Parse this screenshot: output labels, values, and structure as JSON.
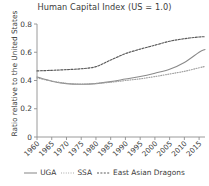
{
  "chart_data": {
    "type": "line",
    "title": "Human Capital Index (US = 1.0)",
    "xlabel": "",
    "ylabel": "Ratio relative to the United States",
    "xlim": [
      1960,
      2017
    ],
    "ylim": [
      0,
      0.8
    ],
    "yticks": [
      "0",
      "0.2",
      "0.4",
      "0.6",
      "0.8"
    ],
    "ytick_values": [
      0,
      0.2,
      0.4,
      0.6,
      0.8
    ],
    "xticks": [
      "1960",
      "1965",
      "1970",
      "1975",
      "1980",
      "1985",
      "1990",
      "1995",
      "2000",
      "2005",
      "2010",
      "2015"
    ],
    "xtick_values": [
      1960,
      1965,
      1970,
      1975,
      1980,
      1985,
      1990,
      1995,
      2000,
      2005,
      2010,
      2015
    ],
    "grid": false,
    "legend_position": "bottom",
    "x": [
      1960,
      1965,
      1970,
      1975,
      1980,
      1985,
      1990,
      1995,
      2000,
      2005,
      2010,
      2015,
      2017
    ],
    "series": [
      {
        "name": "UGA",
        "style": "solid",
        "color": "#8a8a8a",
        "values": [
          0.425,
          0.395,
          0.378,
          0.374,
          0.378,
          0.392,
          0.41,
          0.428,
          0.452,
          0.48,
          0.528,
          0.6,
          0.62
        ]
      },
      {
        "name": "SSA",
        "style": "dotted",
        "color": "#a0a0a0",
        "values": [
          0.418,
          0.396,
          0.38,
          0.374,
          0.379,
          0.388,
          0.4,
          0.412,
          0.428,
          0.446,
          0.465,
          0.49,
          0.5
        ]
      },
      {
        "name": "East Asian Dragons",
        "style": "dashed",
        "color": "#5a5a5a",
        "values": [
          0.468,
          0.472,
          0.477,
          0.483,
          0.498,
          0.545,
          0.59,
          0.622,
          0.65,
          0.678,
          0.696,
          0.708,
          0.71
        ]
      }
    ]
  },
  "legend": {
    "items": [
      {
        "label": "UGA"
      },
      {
        "label": "SSA"
      },
      {
        "label": "East Asian Dragons"
      }
    ]
  }
}
